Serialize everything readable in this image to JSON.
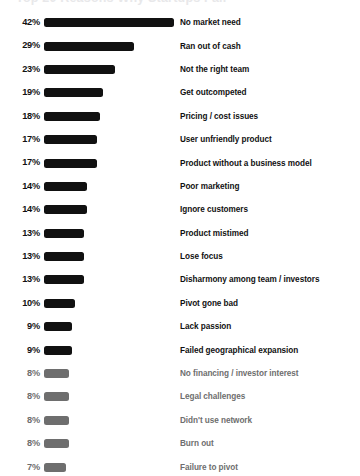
{
  "chart": {
    "title": "Top 20 Reasons Why Startups Fail",
    "title_cropped": true
  },
  "chart_data": {
    "type": "bar",
    "orientation": "horizontal",
    "title": "Top 20 Reasons Why Startups Fail",
    "xlabel": "",
    "ylabel": "",
    "xlim": [
      0,
      42
    ],
    "grid": false,
    "legend": false,
    "value_suffix": "%",
    "categories": [
      "No market need",
      "Ran out of cash",
      "Not the right team",
      "Get outcompeted",
      "Pricing / cost issues",
      "User unfriendly product",
      "Product without a business model",
      "Poor marketing",
      "Ignore customers",
      "Product mistimed",
      "Lose focus",
      "Disharmony among team / investors",
      "Pivot gone bad",
      "Lack passion",
      "Failed geographical expansion",
      "No financing / investor interest",
      "Legal challenges",
      "Didn't use network",
      "Burn out",
      "Failure to pivot"
    ],
    "values": [
      42,
      29,
      23,
      19,
      18,
      17,
      17,
      14,
      14,
      13,
      13,
      13,
      10,
      9,
      9,
      8,
      8,
      8,
      8,
      7
    ],
    "value_labels": [
      "42%",
      "29%",
      "23%",
      "19%",
      "18%",
      "17%",
      "17%",
      "14%",
      "14%",
      "13%",
      "13%",
      "13%",
      "10%",
      "9%",
      "9%",
      "8%",
      "8%",
      "8%",
      "8%",
      "7%"
    ],
    "bar_colors": [
      "#111111",
      "#111111",
      "#111111",
      "#111111",
      "#111111",
      "#111111",
      "#111111",
      "#111111",
      "#111111",
      "#111111",
      "#111111",
      "#111111",
      "#111111",
      "#111111",
      "#111111",
      "#6e6e6e",
      "#6e6e6e",
      "#6e6e6e",
      "#6e6e6e",
      "#6e6e6e"
    ]
  },
  "colors": {
    "background": "#ffffff",
    "bar_strong": "#111111",
    "bar_dim": "#6e6e6e",
    "text_strong": "#111111",
    "text_dim": "#6e6e6e"
  }
}
